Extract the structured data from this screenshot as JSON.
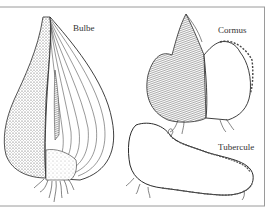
{
  "figure": {
    "labels": {
      "bulb": "Bulbe",
      "corm": "Cormus",
      "tuber": "Tubercule"
    },
    "colors": {
      "ink": "#2a2a2a",
      "frame": "#9a9a9a",
      "background": "#ffffff"
    }
  }
}
